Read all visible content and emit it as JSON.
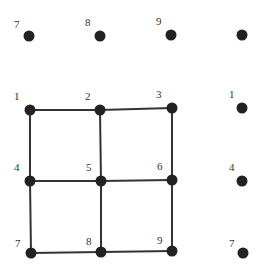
{
  "diagram": {
    "colors": {
      "node": "#222222",
      "edge": "#333333",
      "label": "#333333",
      "background": "#ffffff"
    },
    "nodes": [
      {
        "id": "t7",
        "label": "7",
        "x": 29,
        "y": 36,
        "lx": 14,
        "ly": 28
      },
      {
        "id": "t8",
        "label": "8",
        "x": 100,
        "y": 36,
        "lx": 85,
        "ly": 26
      },
      {
        "id": "t9",
        "label": "9",
        "x": 171,
        "y": 35,
        "lx": 156,
        "ly": 25
      },
      {
        "id": "tr",
        "label": "",
        "x": 242,
        "y": 35,
        "lx": 0,
        "ly": 0
      },
      {
        "id": "n1",
        "label": "1",
        "x": 30,
        "y": 110,
        "lx": 14,
        "ly": 100
      },
      {
        "id": "n2",
        "label": "2",
        "x": 100,
        "y": 110,
        "lx": 85,
        "ly": 100
      },
      {
        "id": "n3",
        "label": "3",
        "x": 172,
        "y": 108,
        "lx": 156,
        "ly": 98
      },
      {
        "id": "r1",
        "label": "1",
        "x": 242,
        "y": 108,
        "lx": 229,
        "ly": 98
      },
      {
        "id": "n4",
        "label": "4",
        "x": 30,
        "y": 181,
        "lx": 14,
        "ly": 171
      },
      {
        "id": "n5",
        "label": "5",
        "x": 101,
        "y": 181,
        "lx": 86,
        "ly": 171
      },
      {
        "id": "n6",
        "label": "6",
        "x": 172,
        "y": 180,
        "lx": 157,
        "ly": 170
      },
      {
        "id": "r4",
        "label": "4",
        "x": 242,
        "y": 181,
        "lx": 229,
        "ly": 171
      },
      {
        "id": "n7",
        "label": "7",
        "x": 31,
        "y": 253,
        "lx": 15,
        "ly": 247
      },
      {
        "id": "n8",
        "label": "8",
        "x": 101,
        "y": 252,
        "lx": 86,
        "ly": 245
      },
      {
        "id": "n9",
        "label": "9",
        "x": 172,
        "y": 251,
        "lx": 157,
        "ly": 244
      },
      {
        "id": "r7",
        "label": "7",
        "x": 243,
        "y": 253,
        "lx": 229,
        "ly": 247
      }
    ],
    "edges": [
      [
        "n1",
        "n2"
      ],
      [
        "n2",
        "n3"
      ],
      [
        "n4",
        "n5"
      ],
      [
        "n5",
        "n6"
      ],
      [
        "n7",
        "n8"
      ],
      [
        "n8",
        "n9"
      ],
      [
        "n1",
        "n4"
      ],
      [
        "n4",
        "n7"
      ],
      [
        "n2",
        "n5"
      ],
      [
        "n5",
        "n8"
      ],
      [
        "n3",
        "n6"
      ],
      [
        "n6",
        "n9"
      ]
    ],
    "caption_partial": "(caption text cut off at bottom edge)"
  }
}
